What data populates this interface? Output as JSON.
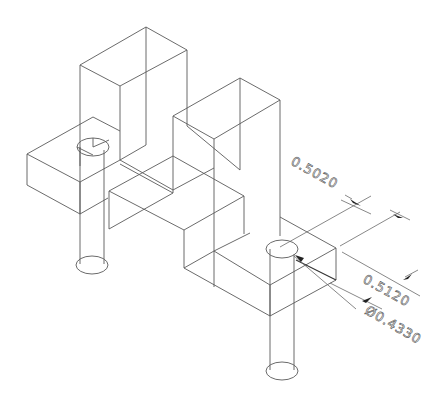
{
  "drawing": {
    "type": "isometric wireframe CAD part",
    "line_color": "#5a5a5a",
    "background": "#ffffff"
  },
  "dimensions": [
    {
      "id": "dim-1",
      "label": "0.5020"
    },
    {
      "id": "dim-2",
      "label": "0.5120"
    },
    {
      "id": "dim-3",
      "label": "Ø0.4330"
    }
  ]
}
